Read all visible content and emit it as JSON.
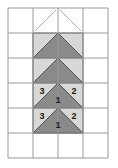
{
  "diagram": {
    "type": "quilt-block-pattern",
    "colors": {
      "background": "#ffffff",
      "grid_line": "#9a9a9a",
      "light_fabric": "#d8d8d6",
      "dark_fabric": "#8a8a88",
      "piece_outline": "#4a4a4a",
      "construction_line": "#b0b0ae",
      "label_text": "#1a1a1a"
    },
    "grid": {
      "columns": 4,
      "rows": 6,
      "cell_width": 25,
      "cell_height": 25,
      "origin_x": 8,
      "origin_y": 8,
      "x_lines": [
        8,
        33,
        58,
        83,
        108
      ],
      "y_lines": [
        8,
        33,
        58,
        83,
        108,
        133,
        158
      ]
    },
    "light_panel": {
      "x": 33,
      "y": 33,
      "width": 50,
      "height": 100
    },
    "chevrons": [
      {
        "name": "chevron-row-2",
        "apex_x": 58,
        "apex_y": 33,
        "left_x": 33,
        "right_x": 83,
        "base_y": 58
      },
      {
        "name": "chevron-row-3",
        "apex_x": 58,
        "apex_y": 58,
        "left_x": 33,
        "right_x": 83,
        "base_y": 83
      },
      {
        "name": "chevron-row-4",
        "apex_x": 58,
        "apex_y": 83,
        "left_x": 33,
        "right_x": 83,
        "base_y": 108
      },
      {
        "name": "chevron-row-5",
        "apex_x": 58,
        "apex_y": 108,
        "left_x": 33,
        "right_x": 83,
        "base_y": 133
      }
    ],
    "construction_lines": [
      {
        "name": "construction-line-left",
        "x1": 35,
        "y1": 31,
        "x2": 56,
        "y2": 10
      },
      {
        "name": "construction-line-right",
        "x1": 60,
        "y1": 10,
        "x2": 81,
        "y2": 31
      }
    ],
    "labels": [
      {
        "id": "label-left-upper",
        "text": "3",
        "x": 42,
        "y": 92
      },
      {
        "id": "label-right-upper",
        "text": "2",
        "x": 74,
        "y": 92
      },
      {
        "id": "label-center-upper",
        "text": "1",
        "x": 58,
        "y": 101
      },
      {
        "id": "label-left-lower",
        "text": "3",
        "x": 42,
        "y": 117
      },
      {
        "id": "label-right-lower",
        "text": "2",
        "x": 74,
        "y": 117
      },
      {
        "id": "label-center-lower",
        "text": "1",
        "x": 58,
        "y": 126
      }
    ]
  }
}
